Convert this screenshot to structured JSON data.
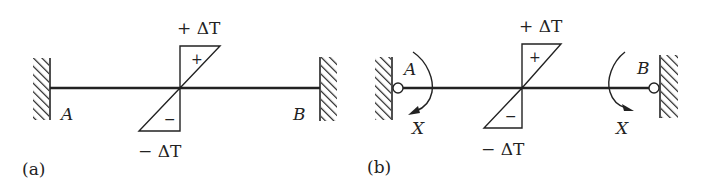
{
  "figure": {
    "panels": [
      {
        "id": "a",
        "caption": "(a)",
        "support_left": {
          "type": "fixed",
          "label": "A"
        },
        "support_right": {
          "type": "fixed",
          "label": "B"
        },
        "temperature_top": "+ ΔT",
        "temperature_bottom": "− ΔT",
        "sign_top": "+",
        "sign_bottom": "−"
      },
      {
        "id": "b",
        "caption": "(b)",
        "support_left": {
          "type": "hinged-to-wall",
          "label": "A",
          "moment_label": "X"
        },
        "support_right": {
          "type": "hinged-to-wall",
          "label": "B",
          "moment_label": "X"
        },
        "temperature_top": "+ ΔT",
        "temperature_bottom": "− ΔT",
        "sign_top": "+",
        "sign_bottom": "−"
      }
    ]
  },
  "colors": {
    "ink": "#222222",
    "background": "#ffffff"
  }
}
